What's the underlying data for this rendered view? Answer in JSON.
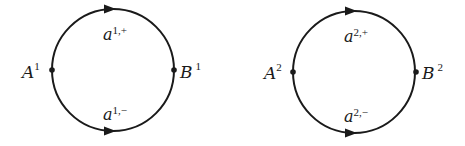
{
  "diagram": {
    "type": "two-circle-graphs",
    "colors": {
      "stroke": "#1a1a1a",
      "background": "#ffffff"
    },
    "circles": [
      {
        "id": 1,
        "vertices": [
          {
            "name": "A",
            "sup": "1",
            "position": "left"
          },
          {
            "name": "B",
            "sup": "1",
            "position": "right"
          }
        ],
        "edges": [
          {
            "name": "a",
            "sup": "1,+",
            "arc": "upper",
            "direction": "left-to-right"
          },
          {
            "name": "a",
            "sup": "1,−",
            "arc": "lower",
            "direction": "left-to-right"
          }
        ]
      },
      {
        "id": 2,
        "vertices": [
          {
            "name": "A",
            "sup": "2",
            "position": "left"
          },
          {
            "name": "B",
            "sup": "2",
            "position": "right"
          }
        ],
        "edges": [
          {
            "name": "a",
            "sup": "2,+",
            "arc": "upper",
            "direction": "left-to-right"
          },
          {
            "name": "a",
            "sup": "2,−",
            "arc": "lower",
            "direction": "left-to-right"
          }
        ]
      }
    ]
  }
}
